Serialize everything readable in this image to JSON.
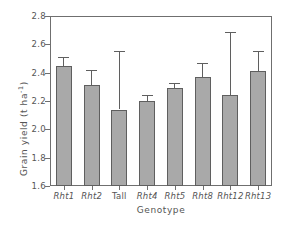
{
  "chart_data": {
    "type": "bar",
    "title": "",
    "xlabel": "Genotype",
    "ylabel": "Grain yield (t ha",
    "ylabel_sup": "-1",
    "ylabel_tail": ")",
    "categories": [
      "Rht1",
      "Rht2",
      "Tall",
      "Rht4",
      "Rht5",
      "Rht8",
      "Rht12",
      "Rht13"
    ],
    "category_styles": [
      "italic",
      "italic",
      "normal",
      "italic",
      "italic",
      "italic",
      "italic",
      "italic"
    ],
    "values": [
      2.45,
      2.31,
      2.14,
      2.2,
      2.29,
      2.37,
      2.24,
      2.41
    ],
    "error_upper": [
      2.51,
      2.42,
      2.55,
      2.24,
      2.33,
      2.47,
      2.69,
      2.55
    ],
    "errors": [
      0.06,
      0.11,
      0.41,
      0.04,
      0.04,
      0.1,
      0.45,
      0.14
    ],
    "ylim": [
      1.6,
      2.8
    ],
    "ytick_values": [
      1.6,
      1.8,
      2.0,
      2.2,
      2.4,
      2.6,
      2.8
    ],
    "ytick_labels": [
      "1.6",
      "1.8",
      "2.0",
      "2.2",
      "2.4",
      "2.6",
      "2.8"
    ],
    "grid": false,
    "legend": "none",
    "bar_color": "#a9a9a9",
    "bar_edge_color": "#5f5f5f",
    "axis_color": "#6f6f6f",
    "error_bar_color": "#5f5f5f",
    "background": "#ffffff",
    "error_bar_style": "upper-only"
  }
}
